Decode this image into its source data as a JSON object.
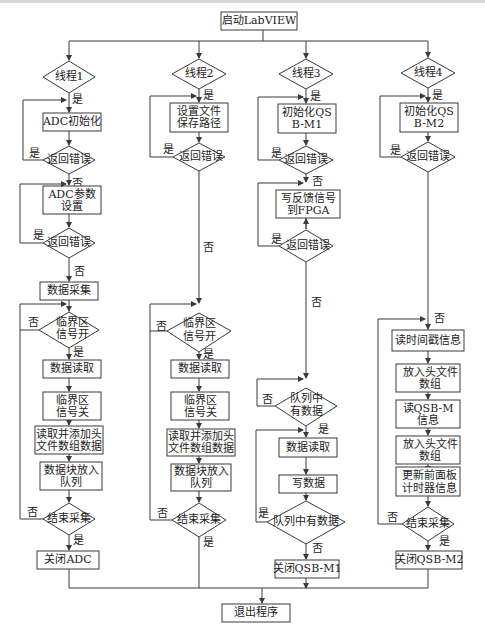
{
  "diagram": {
    "type": "flowchart",
    "start": "启动LabVIEW",
    "end": "退出程序",
    "yes": "是",
    "no": "否",
    "threads": [
      {
        "name": "线程1",
        "nodes": {
          "init": "ADC初始化",
          "check1": "返回错误",
          "setup_l1": "ADC参数",
          "setup_l2": "设置",
          "check2": "返回错误",
          "acquire": "数据采集",
          "crit_l1": "临界区",
          "crit_l2": "信号开",
          "read": "数据读取",
          "critoff_l1": "临界区",
          "critoff_l2": "信号关",
          "addhdr_l1": "读取并添加头",
          "addhdr_l2": "文件数组数据",
          "enqueue_l1": "数据块放入",
          "enqueue_l2": "队列",
          "stop": "结束采集",
          "close": "关闭ADC"
        }
      },
      {
        "name": "线程2",
        "nodes": {
          "init_l1": "设置文件",
          "init_l2": "保存路径",
          "check1": "返回错误",
          "crit_l1": "临界区",
          "crit_l2": "信号开",
          "read": "数据读取",
          "critoff_l1": "临界区",
          "critoff_l2": "信号关",
          "addhdr_l1": "读取并添加头",
          "addhdr_l2": "文件数组数据",
          "enqueue_l1": "数据块放入",
          "enqueue_l2": "队列",
          "stop": "结束采集"
        }
      },
      {
        "name": "线程3",
        "nodes": {
          "init_l1": "初始化QS",
          "init_l2": "B-M1",
          "check1": "返回错误",
          "write_l1": "写反馈信号",
          "write_l2": "到FPGA",
          "check2": "返回错误",
          "queue_l1": "队列中",
          "queue_l2": "有数据",
          "read": "数据读取",
          "write": "写数据",
          "queue2": "队列中有数据",
          "close": "关闭QSB-M1"
        }
      },
      {
        "name": "线程4",
        "nodes": {
          "init_l1": "初始化QS",
          "init_l2": "B-M2",
          "check1": "返回错误",
          "ts": "读时间戳信息",
          "hdr1_l1": "放入头文件",
          "hdr1_l2": "数组",
          "qsb_l1": "读QSB-M",
          "qsb_l2": "信息",
          "hdr2_l1": "放入头文件",
          "hdr2_l2": "数组",
          "upd_l1": "更新前面板",
          "upd_l2": "计时器信息",
          "stop": "结束采集",
          "close": "关闭QSB-M2"
        }
      }
    ]
  }
}
